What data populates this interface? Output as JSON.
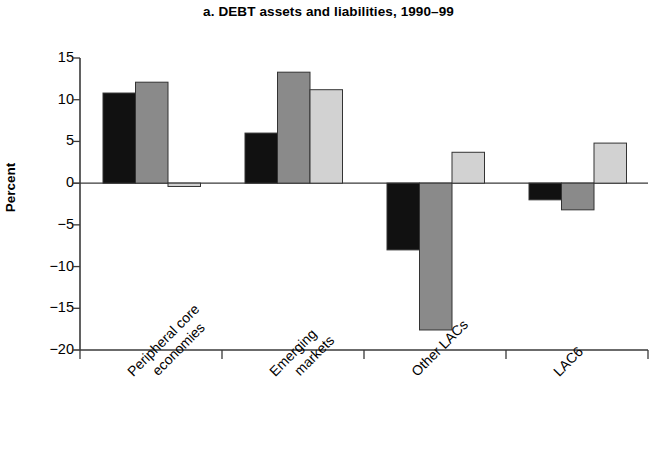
{
  "chart_data": {
    "type": "bar",
    "title": "a. DEBT assets and liabilities, 1990–99",
    "xlabel": "",
    "ylabel": "Percent",
    "ylim": [
      -20,
      15
    ],
    "yticks": [
      15,
      10,
      5,
      0,
      -5,
      -10,
      -15,
      -20
    ],
    "ytick_labels": [
      "15",
      "10",
      "5",
      "0",
      "−5",
      "−10",
      "−15",
      "−20"
    ],
    "grid": false,
    "legend": "none",
    "orientation": "vertical",
    "zero_line": 0,
    "categories": [
      "Peripheral core economies",
      "Emerging markets",
      "Other LACs",
      "LAC6"
    ],
    "category_lines": [
      [
        "Peripheral core",
        "economies"
      ],
      [
        "Emerging",
        "markets"
      ],
      [
        "Other LACs"
      ],
      [
        "LAC6"
      ]
    ],
    "series": [
      {
        "name": "series-1",
        "color": "#111111",
        "values": [
          10.8,
          6.0,
          -8.0,
          -2.0
        ]
      },
      {
        "name": "series-2",
        "color": "#8a8a8a",
        "values": [
          12.1,
          13.3,
          -17.6,
          -3.2
        ]
      },
      {
        "name": "series-3",
        "color": "#d2d2d2",
        "values": [
          -0.4,
          11.2,
          3.7,
          4.8
        ]
      }
    ]
  },
  "colors": {
    "axis": "#3a3a3a",
    "bar_edge": "#333333",
    "background": "#ffffff",
    "series_1": "#111111",
    "series_2": "#8a8a8a",
    "series_3": "#d2d2d2"
  }
}
